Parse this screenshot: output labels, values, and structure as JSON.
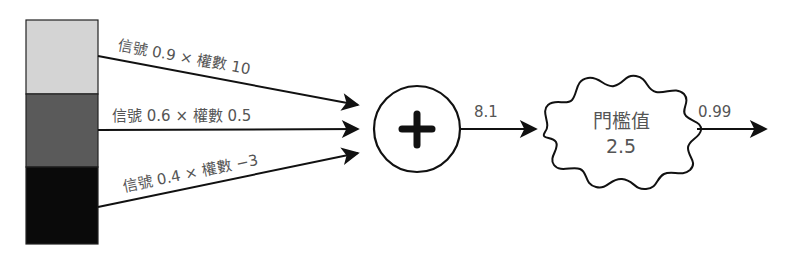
{
  "inputs": [
    {
      "signal_label": "信號",
      "signal": "0.9",
      "times": "×",
      "weight_label": "權數",
      "weight": "10",
      "text": "信號 0.9 × 權數 10",
      "color": "#d4d4d4"
    },
    {
      "signal_label": "信號",
      "signal": "0.6",
      "times": "×",
      "weight_label": "權數",
      "weight": "0.5",
      "text": "信號 0.6 × 權數 0.5",
      "color": "#5a5a5a"
    },
    {
      "signal_label": "信號",
      "signal": "0.4",
      "times": "×",
      "weight_label": "權數",
      "weight": "−3",
      "text": "信號 0.4 × 權數 −3",
      "color": "#0a0a0a"
    }
  ],
  "sum_node": {
    "symbol": "plus-icon"
  },
  "sum_output": "8.1",
  "threshold": {
    "label": "門檻值",
    "value": "2.5"
  },
  "output": "0.99"
}
